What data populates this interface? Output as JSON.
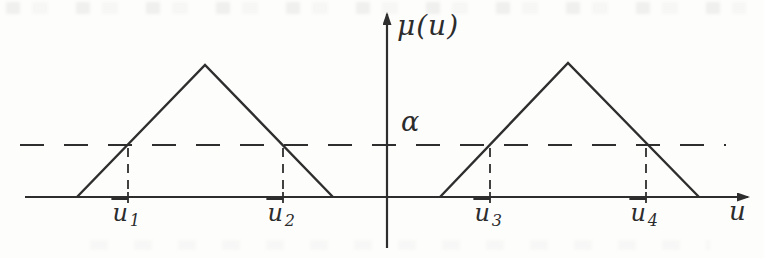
{
  "figure": {
    "y_axis_label": "μ(u)",
    "x_axis_label": "u",
    "alpha_label": "α",
    "u_marks": [
      {
        "base": "u",
        "sub": "1",
        "x": 128
      },
      {
        "base": "u",
        "sub": "2",
        "x": 283
      },
      {
        "base": "u",
        "sub": "3",
        "x": 490
      },
      {
        "base": "u",
        "sub": "4",
        "x": 646
      }
    ],
    "geometry": {
      "x_axis": {
        "y": 197,
        "x1": 25,
        "x2": 748
      },
      "y_axis": {
        "x": 387,
        "y1": 14,
        "y2": 248
      },
      "alpha_line": {
        "y": 145,
        "x1": 20,
        "x2": 726,
        "dash": "24 20"
      },
      "cut_line_dash": "9 7",
      "triangles": [
        {
          "points": "77,197 205,65 333,197"
        },
        {
          "points": "440,197 568,63 699,197"
        }
      ]
    },
    "colors": {
      "ink": "#2e2e2e",
      "background": "#fdfdfc"
    }
  }
}
